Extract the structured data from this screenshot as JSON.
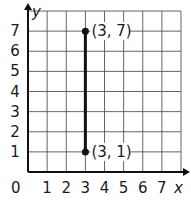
{
  "chart_data": {
    "type": "line",
    "title": "",
    "xlabel": "x",
    "ylabel": "y",
    "xlim": [
      0,
      8
    ],
    "ylim": [
      0,
      8
    ],
    "grid": true,
    "origin_label": "0",
    "x_ticks": [
      "1",
      "2",
      "3",
      "4",
      "5",
      "6",
      "7"
    ],
    "y_ticks": [
      "1",
      "2",
      "3",
      "4",
      "5",
      "6",
      "7"
    ],
    "series": [
      {
        "name": "segment",
        "points": [
          {
            "x": 3,
            "y": 1
          },
          {
            "x": 3,
            "y": 7
          }
        ],
        "color": "#111111"
      }
    ],
    "annotations": [
      {
        "x": 3,
        "y": 7,
        "text": "(3, 7)"
      },
      {
        "x": 3,
        "y": 1,
        "text": "(3, 1)"
      }
    ]
  },
  "colors": {
    "grid": "#555555",
    "axis": "#111111",
    "segment": "#111111"
  }
}
